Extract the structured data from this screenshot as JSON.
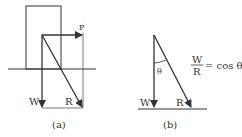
{
  "panel_a": {
    "caption": "(a)",
    "labels": {
      "P": "P",
      "W": "W",
      "R": "R"
    }
  },
  "panel_b": {
    "caption": "(b)",
    "labels": {
      "W": "W",
      "R": "R",
      "theta": "θ"
    },
    "equation": {
      "numerator": "W",
      "denominator": "R",
      "rhs": "= cos θ"
    }
  },
  "colors": {
    "stroke": "#333333",
    "background": "#ffffff"
  }
}
